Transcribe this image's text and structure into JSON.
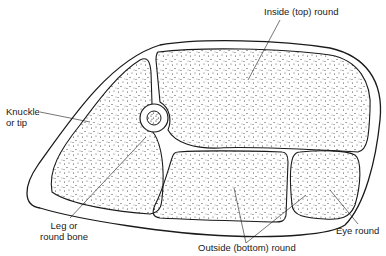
{
  "diagram": {
    "type": "cross-section illustration",
    "colors": {
      "line": "#1a1a1a",
      "background": "#ffffff",
      "stipple": "#333333"
    },
    "labels": {
      "inside_round": "Inside (top) round",
      "knuckle_line1": "Knuckle",
      "knuckle_line2": "or tip",
      "bone_line1": "Leg or",
      "bone_line2": "round bone",
      "outside_round": "Outside (bottom) round",
      "eye_round": "Eye round"
    },
    "regions": [
      {
        "id": "inside-round",
        "label": "Inside (top) round"
      },
      {
        "id": "knuckle",
        "label": "Knuckle or tip"
      },
      {
        "id": "round-bone",
        "label": "Leg or round bone"
      },
      {
        "id": "outside-round",
        "label": "Outside (bottom) round"
      },
      {
        "id": "eye-round",
        "label": "Eye round"
      }
    ]
  }
}
